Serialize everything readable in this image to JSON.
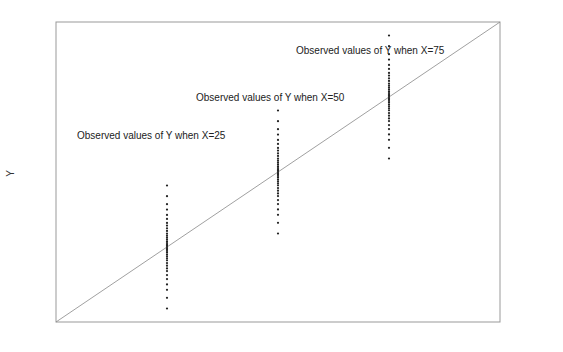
{
  "chart_data": {
    "type": "scatter",
    "title": "",
    "xlabel": "",
    "ylabel": "Y",
    "grid": false,
    "reference_line": {
      "type": "diagonal",
      "from": [
        0,
        0
      ],
      "to": [
        100,
        100
      ]
    },
    "series": [
      {
        "name": "Observed values of Y when X=25",
        "x": 25,
        "y_center": 25,
        "y_range": [
          8,
          49
        ]
      },
      {
        "name": "Observed values of Y when X=50",
        "x": 50,
        "y_center": 50,
        "y_range": [
          33,
          74
        ]
      },
      {
        "name": "Observed values of Y when X=75",
        "x": 75,
        "y_center": 75,
        "y_range": [
          58,
          99
        ]
      }
    ],
    "annotations": [
      "Observed values of Y when X=25",
      "Observed values of Y when X=50",
      "Observed values of Y when X=75"
    ]
  },
  "labels": {
    "y_axis": "Y",
    "a25": "Observed values of Y when X=25",
    "a50": "Observed values of Y when X=50",
    "a75": "Observed values of Y when X=75"
  }
}
